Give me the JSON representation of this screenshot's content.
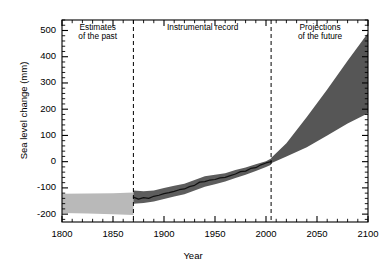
{
  "chart_data": {
    "type": "area",
    "title": "",
    "xlabel": "Year",
    "ylabel": "Sea level change (mm)",
    "xlim": [
      1800,
      2100
    ],
    "ylim": [
      -230,
      540
    ],
    "xticks": [
      1800,
      1850,
      1900,
      1950,
      2000,
      2050,
      2100
    ],
    "yticks": [
      -200,
      -100,
      0,
      100,
      200,
      300,
      400,
      500
    ],
    "xtick_labels": [
      "1800",
      "1850",
      "1900",
      "1950",
      "2000",
      "2050",
      "2100"
    ],
    "ytick_labels": [
      "-200",
      "-100",
      "0",
      "100",
      "200",
      "300",
      "400",
      "500"
    ],
    "x_minor_tick_step": 10,
    "y_minor_tick_step": 20,
    "grid": false,
    "legend": "none",
    "annotations": [
      {
        "name": "estimates-of-the-past",
        "text": "Estimates\nof the past",
        "x": 1835,
        "y": 505
      },
      {
        "name": "instrumental-record",
        "text": "Instrumental record",
        "x": 1938,
        "y": 505
      },
      {
        "name": "projections-of-the-future",
        "text": "Projections\nof the future",
        "x": 2053,
        "y": 505
      }
    ],
    "vertical_dividers": [
      {
        "name": "divider-1870",
        "x": 1870,
        "style": "dashed"
      },
      {
        "name": "divider-2005",
        "x": 2005,
        "style": "dashed"
      }
    ],
    "colors": {
      "past_band": "#b9b9b9",
      "instrumental_band": "#5d5d5d",
      "instrumental_line": "#111111",
      "projection_band": "#565656",
      "axis": "#000000"
    },
    "series": [
      {
        "name": "Estimates of the past (uncertainty band)",
        "type": "band",
        "color": "#b9b9b9",
        "x": [
          1800,
          1825,
          1850,
          1870
        ],
        "upper": [
          -122,
          -121,
          -120,
          -118
        ],
        "lower": [
          -196,
          -198,
          -200,
          -203
        ]
      },
      {
        "name": "Instrumental record (uncertainty band)",
        "type": "band",
        "color": "#5d5d5d",
        "x": [
          1870,
          1880,
          1890,
          1900,
          1910,
          1920,
          1930,
          1940,
          1950,
          1960,
          1970,
          1980,
          1990,
          2000,
          2005
        ],
        "upper": [
          -110,
          -113,
          -110,
          -100,
          -92,
          -84,
          -70,
          -56,
          -50,
          -44,
          -32,
          -22,
          -10,
          2,
          12
        ],
        "lower": [
          -160,
          -158,
          -152,
          -142,
          -133,
          -124,
          -110,
          -96,
          -86,
          -76,
          -62,
          -50,
          -36,
          -20,
          -12
        ]
      },
      {
        "name": "Instrumental record (central estimate)",
        "type": "line",
        "color": "#111111",
        "x": [
          1870,
          1875,
          1880,
          1885,
          1890,
          1895,
          1900,
          1905,
          1910,
          1915,
          1920,
          1925,
          1930,
          1935,
          1940,
          1945,
          1950,
          1955,
          1960,
          1965,
          1970,
          1975,
          1980,
          1985,
          1990,
          1995,
          2000,
          2005
        ],
        "values": [
          -135,
          -143,
          -137,
          -140,
          -132,
          -128,
          -122,
          -118,
          -113,
          -107,
          -104,
          -95,
          -90,
          -78,
          -76,
          -70,
          -68,
          -62,
          -60,
          -53,
          -47,
          -38,
          -36,
          -26,
          -23,
          -12,
          -5,
          0
        ]
      },
      {
        "name": "Projections of the future (range)",
        "type": "band",
        "color": "#565656",
        "x": [
          2005,
          2020,
          2040,
          2060,
          2080,
          2100
        ],
        "upper": [
          14,
          70,
          170,
          275,
          385,
          490
        ],
        "lower": [
          -6,
          20,
          55,
          100,
          145,
          185
        ]
      }
    ]
  }
}
